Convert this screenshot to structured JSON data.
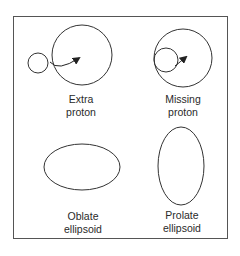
{
  "diagram": {
    "panels": [
      {
        "id": "extra-proton",
        "label_line1": "Extra",
        "label_line2": "proton"
      },
      {
        "id": "missing-proton",
        "label_line1": "Missing",
        "label_line2": "proton"
      },
      {
        "id": "oblate",
        "label_line1": "Oblate",
        "label_line2": "ellipsoid"
      },
      {
        "id": "prolate",
        "label_line1": "Prolate",
        "label_line2": "ellipsoid"
      }
    ],
    "colors": {
      "stroke": "#333333",
      "background": "#ffffff",
      "frame": "#555555"
    }
  }
}
